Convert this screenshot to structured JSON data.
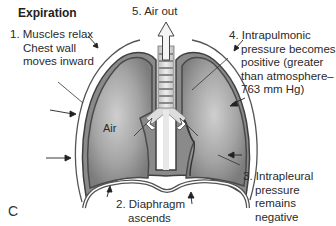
{
  "title": "Expiration",
  "panel_letter": "C",
  "labels": {
    "step1": [
      "1. Muscles relax",
      "Chest wall",
      "moves inward"
    ],
    "step2": [
      "2. Diaphragm",
      "ascends"
    ],
    "step3": [
      "3. Intrapleural",
      "pressure",
      "remains",
      "negative"
    ],
    "step4": [
      "4. Intrapulmonic",
      "pressure becomes",
      "positive (greater",
      "than atmosphere–",
      "763 mm Hg)"
    ],
    "step5": "5. Air out",
    "air": "Air"
  },
  "colors": {
    "lung_fill": "#9a9a9a",
    "lung_highlight": "#c8c8c8",
    "lung_outline": "#4a4a4a",
    "chest_wall": "#555555",
    "background": "#ffffff"
  }
}
